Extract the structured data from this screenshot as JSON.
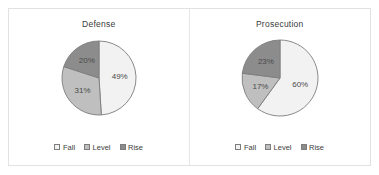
{
  "panel": {
    "background_color": "#ffffff",
    "border_color": "#e2e2e2"
  },
  "palette": {
    "fall": "#f2f2f2",
    "level": "#bfbfbf",
    "rise": "#8c8c8c",
    "slice_outline": "#7d7d7d",
    "label_text": "#4a4a4a",
    "title_text": "#3a3a3a"
  },
  "legend": {
    "items": [
      {
        "label": "Fall",
        "color": "#f2f2f2"
      },
      {
        "label": "Level",
        "color": "#bfbfbf"
      },
      {
        "label": "Rise",
        "color": "#8c8c8c"
      }
    ]
  },
  "charts": [
    {
      "title": "Defense",
      "labels": [
        "49%",
        "31%",
        "20%"
      ]
    },
    {
      "title": "Prosecution",
      "labels": [
        "60%",
        "17%",
        "23%"
      ]
    }
  ],
  "chart_data": [
    {
      "type": "pie",
      "title": "Defense",
      "categories": [
        "Fall",
        "Level",
        "Rise"
      ],
      "values": [
        49,
        31,
        20
      ],
      "value_unit": "percent",
      "data_labels": [
        "49%",
        "31%",
        "20%"
      ],
      "colors": [
        "#f2f2f2",
        "#bfbfbf",
        "#8c8c8c"
      ],
      "start_angle_deg": 0,
      "direction": "clockwise",
      "legend_position": "bottom",
      "grid": false,
      "xlabel": "",
      "ylabel": ""
    },
    {
      "type": "pie",
      "title": "Prosecution",
      "categories": [
        "Fall",
        "Level",
        "Rise"
      ],
      "values": [
        60,
        17,
        23
      ],
      "value_unit": "percent",
      "data_labels": [
        "60%",
        "17%",
        "23%"
      ],
      "colors": [
        "#f2f2f2",
        "#bfbfbf",
        "#8c8c8c"
      ],
      "start_angle_deg": 0,
      "direction": "clockwise",
      "legend_position": "bottom",
      "grid": false,
      "xlabel": "",
      "ylabel": ""
    }
  ]
}
